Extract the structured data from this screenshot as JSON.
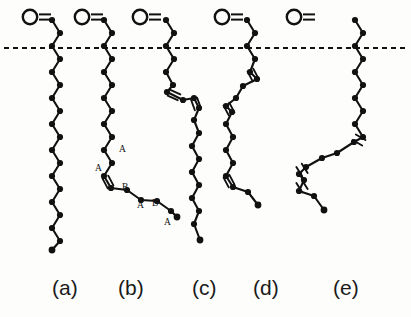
{
  "figure": {
    "background_color": "#fdfdfb",
    "stroke_color": "#111111",
    "width": 411,
    "height": 317,
    "reference_line": {
      "name": "membrane-reference-line",
      "style": "dashed",
      "y": 48,
      "x_start": 4,
      "x_end": 407,
      "dash": "5 4"
    },
    "carbonyl_glyph": {
      "oxygen_letter": "O",
      "bond_symbol": "=",
      "description": "carbonyl oxygen double bonded to first chain carbon"
    },
    "panels": [
      {
        "id": "a",
        "label": "(a)",
        "label_x": 52,
        "label_y": 295,
        "carbonyl_x": 30,
        "carbonyl_y": 17,
        "double_bonds": 0,
        "ab_labels": []
      },
      {
        "id": "b",
        "label": "(b)",
        "label_x": 118,
        "label_y": 295,
        "carbonyl_x": 82,
        "carbonyl_y": 17,
        "double_bonds": 1,
        "ab_labels": [
          "A",
          "A",
          "B",
          "A",
          "B",
          "A"
        ]
      },
      {
        "id": "c",
        "label": "(c)",
        "label_x": 192,
        "label_y": 295,
        "carbonyl_x": 140,
        "carbonyl_y": 17,
        "double_bonds": 2,
        "ab_labels": []
      },
      {
        "id": "d",
        "label": "(d)",
        "label_x": 253,
        "label_y": 295,
        "carbonyl_x": 222,
        "carbonyl_y": 17,
        "double_bonds": 3,
        "ab_labels": []
      },
      {
        "id": "e",
        "label": "(e)",
        "label_x": 333,
        "label_y": 295,
        "carbonyl_x": 294,
        "carbonyl_y": 17,
        "double_bonds": 3,
        "ab_labels": []
      }
    ],
    "chains": {
      "a": {
        "points": "52,20 60,33 52,46 60,59 52,72 60,85 52,98 60,111 52,124 60,137 52,150 60,163 52,176 60,189 52,202 60,215 52,228 60,241 52,250",
        "vertices": [
          [
            52,
            20
          ],
          [
            60,
            33
          ],
          [
            52,
            46
          ],
          [
            60,
            59
          ],
          [
            52,
            72
          ],
          [
            60,
            85
          ],
          [
            52,
            98
          ],
          [
            60,
            111
          ],
          [
            52,
            124
          ],
          [
            60,
            137
          ],
          [
            52,
            150
          ],
          [
            60,
            163
          ],
          [
            52,
            176
          ],
          [
            60,
            189
          ],
          [
            52,
            202
          ],
          [
            60,
            215
          ],
          [
            52,
            228
          ],
          [
            60,
            241
          ]
        ],
        "terminal": [
          52,
          250
        ],
        "hashes": []
      },
      "b": {
        "points": "104,20 112,33 104,46 112,59 104,72 112,85 104,98 112,111 104,124 112,137 104,150 112,163 104,176 111,188 127,190 141,200 157,201 171,211 177,217",
        "vertices": [
          [
            104,
            20
          ],
          [
            112,
            33
          ],
          [
            104,
            46
          ],
          [
            112,
            59
          ],
          [
            104,
            72
          ],
          [
            112,
            85
          ],
          [
            104,
            98
          ],
          [
            112,
            111
          ],
          [
            104,
            124
          ],
          [
            112,
            137
          ],
          [
            104,
            150
          ],
          [
            112,
            163
          ],
          [
            104,
            176
          ],
          [
            111,
            188
          ],
          [
            127,
            190
          ],
          [
            141,
            200
          ],
          [
            157,
            201
          ],
          [
            171,
            211
          ]
        ],
        "terminal": [
          177,
          217
        ],
        "hashes": [
          {
            "x": 108,
            "y": 182,
            "angle": 62
          }
        ],
        "label_points": [
          {
            "text": "A",
            "x": 119,
            "y": 152
          },
          {
            "text": "A",
            "x": 95,
            "y": 171
          },
          {
            "text": "B",
            "x": 122,
            "y": 190
          },
          {
            "text": "A",
            "x": 137,
            "y": 208
          },
          {
            "text": "B",
            "x": 152,
            "y": 206
          },
          {
            "text": "A",
            "x": 164,
            "y": 225
          }
        ]
      },
      "c": {
        "points": "166,20 174,33 166,46 174,59 166,72 173,85 167,92 183,100 194,98 199,108 194,120 199,133 192,146 199,159 192,172 199,185 192,198 199,211 194,224 200,240",
        "vertices": [
          [
            166,
            20
          ],
          [
            174,
            33
          ],
          [
            166,
            46
          ],
          [
            174,
            59
          ],
          [
            166,
            72
          ],
          [
            173,
            85
          ],
          [
            167,
            92
          ],
          [
            183,
            100
          ],
          [
            194,
            98
          ],
          [
            199,
            108
          ],
          [
            194,
            120
          ],
          [
            199,
            133
          ],
          [
            192,
            146
          ],
          [
            199,
            159
          ],
          [
            192,
            172
          ],
          [
            199,
            185
          ],
          [
            192,
            198
          ],
          [
            199,
            211
          ],
          [
            194,
            224
          ]
        ],
        "terminal": [
          200,
          240
        ],
        "hashes": [
          {
            "x": 174,
            "y": 95,
            "angle": 25
          },
          {
            "x": 196,
            "y": 104,
            "angle": 70
          }
        ]
      },
      "d": {
        "points": "247,20 255,33 247,46 255,59 250,72 257,79 243,86 236,98 226,106 232,112 226,124 233,137 226,150 233,163 226,176 233,187 248,192 258,205",
        "vertices": [
          [
            247,
            20
          ],
          [
            255,
            33
          ],
          [
            247,
            46
          ],
          [
            255,
            59
          ],
          [
            250,
            72
          ],
          [
            257,
            79
          ],
          [
            243,
            86
          ],
          [
            236,
            98
          ],
          [
            226,
            106
          ],
          [
            232,
            112
          ],
          [
            226,
            124
          ],
          [
            233,
            137
          ],
          [
            226,
            150
          ],
          [
            233,
            163
          ],
          [
            226,
            176
          ],
          [
            233,
            187
          ],
          [
            248,
            192
          ]
        ],
        "terminal": [
          258,
          205
        ],
        "hashes": [
          {
            "x": 253,
            "y": 75,
            "angle": 62
          },
          {
            "x": 229,
            "y": 109,
            "angle": 62
          },
          {
            "x": 229,
            "y": 181,
            "angle": 62
          }
        ]
      },
      "e": {
        "points": "355,20 363,33 355,46 363,59 355,72 363,85 355,98 363,111 355,124 363,137 354,142 337,153 322,158 306,167 299,174 304,180 299,191 314,196 324,210",
        "vertices": [
          [
            355,
            20
          ],
          [
            363,
            33
          ],
          [
            355,
            46
          ],
          [
            363,
            59
          ],
          [
            355,
            72
          ],
          [
            363,
            85
          ],
          [
            355,
            98
          ],
          [
            363,
            111
          ],
          [
            355,
            124
          ],
          [
            363,
            137
          ],
          [
            354,
            142
          ],
          [
            337,
            153
          ],
          [
            322,
            158
          ],
          [
            306,
            167
          ],
          [
            299,
            174
          ],
          [
            304,
            180
          ],
          [
            299,
            191
          ],
          [
            314,
            196
          ]
        ],
        "terminal": [
          324,
          210
        ],
        "hashes": [
          {
            "x": 359,
            "y": 140,
            "angle": 30
          },
          {
            "x": 302,
            "y": 170,
            "angle": 58
          },
          {
            "x": 302,
            "y": 186,
            "angle": 58
          }
        ]
      }
    }
  }
}
